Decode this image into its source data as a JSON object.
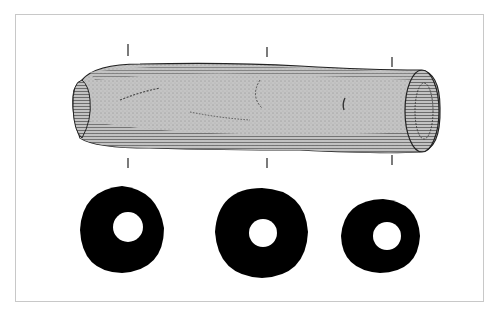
{
  "figure": {
    "colors": {
      "background": "#ffffff",
      "frame": "#c8c8c8",
      "stipple_fill": "#bdbdbd",
      "ink": "#111111",
      "section": "#000000"
    },
    "object": {
      "left": 72,
      "right": 438,
      "top": 62,
      "bottom": 155
    },
    "section_marks": [
      {
        "x": 128,
        "top_y": [
          44,
          56
        ],
        "bottom_y": [
          158,
          168
        ]
      },
      {
        "x": 267,
        "top_y": [
          47,
          57
        ],
        "bottom_y": [
          158,
          168
        ]
      },
      {
        "x": 392,
        "top_y": [
          57,
          67
        ],
        "bottom_y": [
          155,
          165
        ]
      }
    ],
    "cross_sections": [
      {
        "cx": 122,
        "cy": 230,
        "rx": 42,
        "ry": 44,
        "hole_r": 15,
        "hole_cx": 128,
        "hole_cy": 227
      },
      {
        "cx": 262,
        "cy": 232,
        "rx": 47,
        "ry": 46,
        "hole_r": 14,
        "hole_cx": 263,
        "hole_cy": 233
      },
      {
        "cx": 381,
        "cy": 234,
        "rx": 40,
        "ry": 38,
        "hole_r": 14,
        "hole_cx": 387,
        "hole_cy": 236
      }
    ]
  }
}
